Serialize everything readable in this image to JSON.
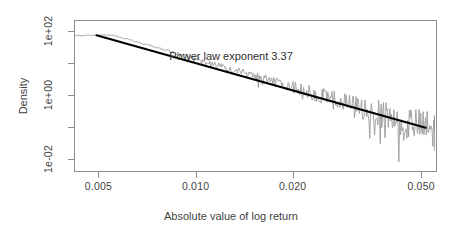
{
  "chart_data": {
    "type": "line",
    "title": "",
    "xlabel": "Absolute value of log return",
    "ylabel": "Density",
    "xscale": "log",
    "yscale": "log",
    "grid": false,
    "legend": null,
    "xlim": [
      0.0042,
      0.056
    ],
    "ylim": [
      0.004,
      220
    ],
    "xticks": [
      {
        "value": 0.005,
        "label": "0.005"
      },
      {
        "value": 0.01,
        "label": "0.010"
      },
      {
        "value": 0.02,
        "label": "0.020"
      },
      {
        "value": 0.05,
        "label": "0.050"
      }
    ],
    "yticks": [
      {
        "value": 100,
        "label": "1e+02"
      },
      {
        "value": 1,
        "label": "1e+00"
      },
      {
        "value": 0.01,
        "label": "1e-02"
      }
    ],
    "yminorticks": [
      10,
      0.1
    ],
    "annotations": [
      {
        "text": "Power law exponent 3.37",
        "x": 0.0152,
        "y": 14.0
      }
    ],
    "power_law_exponent": 3.37,
    "series": [
      {
        "name": "empirical density",
        "style": "noisy-line",
        "color": "#9a9a9a",
        "x": [
          0.0042,
          0.00432,
          0.00445,
          0.00458,
          0.00471,
          0.00485,
          0.00499,
          0.00514,
          0.00529,
          0.00545,
          0.00561,
          0.00577,
          0.00594,
          0.00612,
          0.0063,
          0.00648,
          0.00667,
          0.00687,
          0.00707,
          0.00728,
          0.00749,
          0.00771,
          0.00794,
          0.00818,
          0.00842,
          0.00866,
          0.00892,
          0.00918,
          0.00945,
          0.00973,
          0.01002,
          0.01031,
          0.01061,
          0.01093,
          0.01125,
          0.01158,
          0.01192,
          0.01227,
          0.01263,
          0.013,
          0.01339,
          0.01378,
          0.01418,
          0.0146,
          0.01503,
          0.01547,
          0.01593,
          0.0164,
          0.01688,
          0.01737,
          0.01788,
          0.01841,
          0.01895,
          0.0195,
          0.02008,
          0.02067,
          0.02127,
          0.0219,
          0.02254,
          0.0232,
          0.02389,
          0.02459,
          0.02531,
          0.02606,
          0.02682,
          0.02761,
          0.02842,
          0.02926,
          0.03012,
          0.031,
          0.03191,
          0.03285,
          0.03382,
          0.03481,
          0.03584,
          0.03689,
          0.03797,
          0.03909,
          0.04024,
          0.04142,
          0.04264,
          0.0439,
          0.04519,
          0.04652,
          0.04789,
          0.0493,
          0.05075,
          0.05225,
          0.05379,
          0.05538
        ],
        "y": [
          76.0,
          77.5,
          76.8,
          78.4,
          77.1,
          79.0,
          78.2,
          80.5,
          79.4,
          78.8,
          74.0,
          69.0,
          64.0,
          59.0,
          54.5,
          50.0,
          46.0,
          42.5,
          39.0,
          36.0,
          33.0,
          30.5,
          28.0,
          25.8,
          23.7,
          21.8,
          20.0,
          18.4,
          16.9,
          15.5,
          14.2,
          13.0,
          11.9,
          11.0,
          10.1,
          9.25,
          8.48,
          7.77,
          7.12,
          6.52,
          5.97,
          5.47,
          5.01,
          4.59,
          4.2,
          3.85,
          3.52,
          3.22,
          2.95,
          2.7,
          2.47,
          2.26,
          2.07,
          1.89,
          1.73,
          1.58,
          1.45,
          1.32,
          1.21,
          1.11,
          1.01,
          0.925,
          0.846,
          0.773,
          0.707,
          0.646,
          0.59,
          0.539,
          0.493,
          0.45,
          0.411,
          0.375,
          0.343,
          0.313,
          0.285,
          0.26,
          0.237,
          0.216,
          0.197,
          0.18,
          0.164,
          0.149,
          0.136,
          0.124,
          0.113,
          0.103,
          0.094,
          0.085,
          0.078,
          0.071
        ]
      },
      {
        "name": "power law fit",
        "style": "straight-line",
        "color": "#000000",
        "x": [
          0.0049,
          0.052
        ],
        "y": [
          78.0,
          0.093
        ]
      }
    ]
  },
  "axes": {
    "x_title": "Absolute value of log return",
    "y_title": "Density",
    "x_tick_labels": [
      "0.005",
      "0.010",
      "0.020",
      "0.050"
    ],
    "y_tick_labels": [
      "1e+02",
      "1e+00",
      "1e-02"
    ]
  },
  "annotation": {
    "text": "Power law exponent 3.37"
  },
  "colors": {
    "data_line": "#9a9a9a",
    "fit_line": "#000000",
    "frame": "#8c8c8c",
    "text": "#3f3f3f",
    "background": "#ffffff"
  }
}
